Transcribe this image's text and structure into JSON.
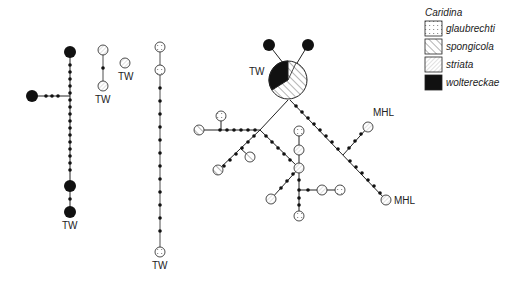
{
  "legend": {
    "title": "Caridina",
    "items": [
      {
        "label": "glaubrechti",
        "pattern": "dots"
      },
      {
        "label": "spongicola",
        "pattern": "hatch-wide"
      },
      {
        "label": "striata",
        "pattern": "hatch-fine"
      },
      {
        "label": "woltereckae",
        "pattern": "solid"
      }
    ]
  },
  "labels": {
    "tw1": "TW",
    "tw2": "TW",
    "tw3": "TW",
    "tw4": "TW",
    "tw5": "TW",
    "mhl1": "MHL",
    "mhl2": "MHL"
  },
  "colors": {
    "line": "#222222",
    "solid": "#111111",
    "background": "#ffffff"
  }
}
